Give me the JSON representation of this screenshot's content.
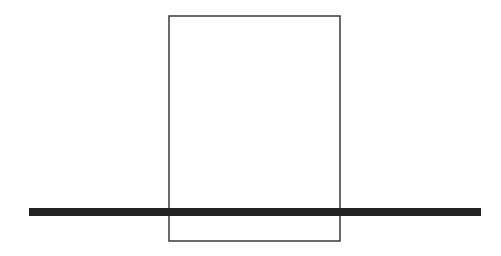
{
  "diagram": {
    "rectangle": {
      "x": 169,
      "y": 16,
      "width": 171,
      "height": 225,
      "stroke": "#3a3a3a",
      "stroke_width": 1.5
    },
    "bar": {
      "x": 29,
      "y": 208,
      "width": 452,
      "height": 8,
      "fill": "#222222"
    }
  }
}
